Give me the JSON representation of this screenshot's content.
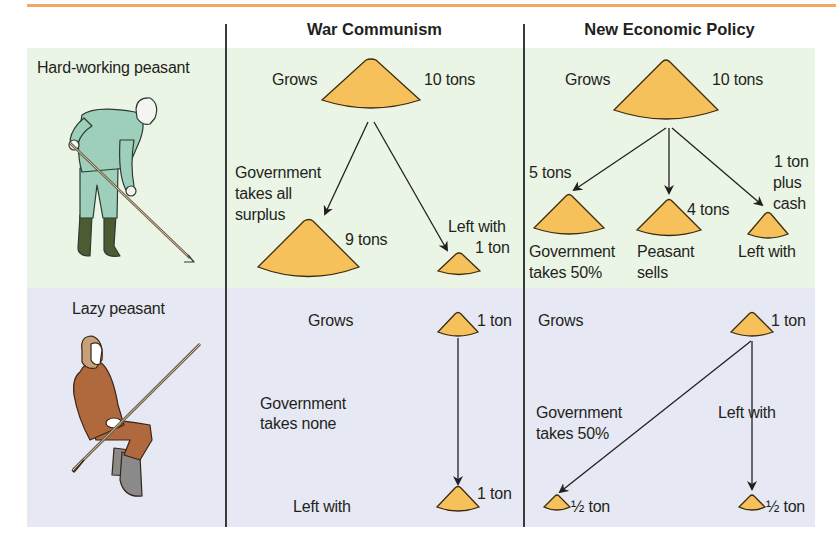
{
  "colors": {
    "accent_rule": "#f0a868",
    "hardworking_band": "#ebf5e6",
    "lazy_band": "#e6e9f3",
    "grain": "#f6c15a",
    "grain_outline": "#3a2a10",
    "divider": "#3a3a3a"
  },
  "columns": [
    {
      "title": "War Communism"
    },
    {
      "title": "New Economic Policy"
    }
  ],
  "rows": [
    {
      "label": "Hard-working peasant",
      "figure": "hardworking-peasant-illustration",
      "war_communism": {
        "grows_label": "Grows",
        "grows_amount": "10 tons",
        "government_label": "Government takes all surplus",
        "government_lines": [
          "Government",
          "takes all",
          "surplus"
        ],
        "government_amount": "9 tons",
        "left_label": "Left with",
        "left_amount": "1 ton"
      },
      "nep": {
        "grows_label": "Grows",
        "grows_amount": "10 tons",
        "government_amount": "5 tons",
        "government_lines": [
          "Government",
          "takes 50%"
        ],
        "sells_amount": "4 tons",
        "sells_lines": [
          "Peasant",
          "sells"
        ],
        "left_amount_lines": [
          "1 ton",
          "plus",
          "cash"
        ],
        "left_label": "Left with"
      }
    },
    {
      "label": "Lazy peasant",
      "figure": "lazy-peasant-illustration",
      "war_communism": {
        "grows_label": "Grows",
        "grows_amount": "1 ton",
        "government_lines": [
          "Government",
          "takes none"
        ],
        "left_label": "Left with",
        "left_amount": "1 ton"
      },
      "nep": {
        "grows_label": "Grows",
        "grows_amount": "1 ton",
        "government_lines": [
          "Government",
          "takes 50%"
        ],
        "government_amount": "½ ton",
        "left_label": "Left with",
        "left_amount": "½ ton"
      }
    }
  ]
}
